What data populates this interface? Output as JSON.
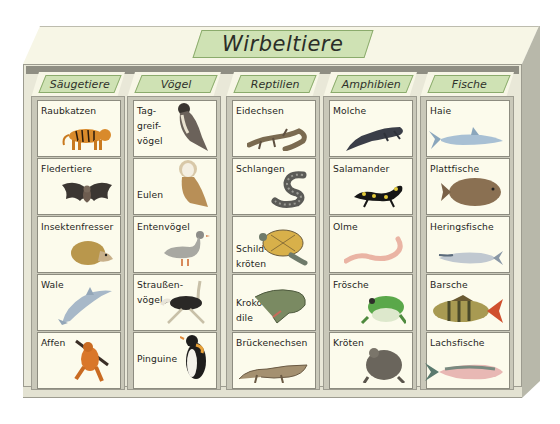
{
  "title": "Wirbeltiere",
  "colors": {
    "label_fill": "#cfe2b4",
    "label_border": "#8bab6c",
    "shelf_face": "#f7f6e6",
    "shelf_frame": "#c9c8b9",
    "cell_bg": "#fcfbec"
  },
  "columns": [
    {
      "label": "Säugetiere",
      "cells": [
        {
          "label": "Raubkatzen",
          "animal": "tiger"
        },
        {
          "label": "Fledertiere",
          "animal": "bat"
        },
        {
          "label": "Insektenfresser",
          "animal": "hedgehog"
        },
        {
          "label": "Wale",
          "animal": "dolphin"
        },
        {
          "label": "Affen",
          "animal": "orangutan"
        }
      ]
    },
    {
      "label": "Vögel",
      "cells": [
        {
          "label": "Tag-\ngreif-\nvögel",
          "animal": "falcon"
        },
        {
          "label": "Eulen",
          "animal": "owl"
        },
        {
          "label": "Entenvögel",
          "animal": "goose"
        },
        {
          "label": "Straußen-\nvögel",
          "animal": "ostrich"
        },
        {
          "label": "Pinguine",
          "animal": "penguin"
        }
      ]
    },
    {
      "label": "Reptilien",
      "cells": [
        {
          "label": "Eidechsen",
          "animal": "lizard"
        },
        {
          "label": "Schlangen",
          "animal": "snake"
        },
        {
          "label": "Schild-\nkröten",
          "animal": "turtle"
        },
        {
          "label": "Kroko-\ndile",
          "animal": "crocodile"
        },
        {
          "label": "Brückenechsen",
          "animal": "tuatara"
        }
      ]
    },
    {
      "label": "Amphibien",
      "cells": [
        {
          "label": "Molche",
          "animal": "newt"
        },
        {
          "label": "Salamander",
          "animal": "fire-salamander"
        },
        {
          "label": "Olme",
          "animal": "olm"
        },
        {
          "label": "Frösche",
          "animal": "frog"
        },
        {
          "label": "Kröten",
          "animal": "toad"
        }
      ]
    },
    {
      "label": "Fische",
      "cells": [
        {
          "label": "Haie",
          "animal": "shark"
        },
        {
          "label": "Plattfische",
          "animal": "flatfish"
        },
        {
          "label": "Heringsfische",
          "animal": "herring"
        },
        {
          "label": "Barsche",
          "animal": "perch"
        },
        {
          "label": "Lachsfische",
          "animal": "salmon"
        }
      ]
    }
  ]
}
